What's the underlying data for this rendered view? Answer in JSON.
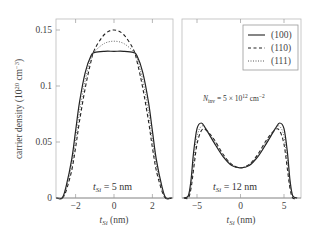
{
  "chart_data": [
    {
      "type": "line",
      "panel": "left",
      "annotation": "t_Si = 5 nm",
      "xlabel": "t_Si (nm)",
      "ylabel": "carrier density (10^20 cm^-3)",
      "xlim": [
        -3.2,
        3.2
      ],
      "ylim": [
        0,
        0.16
      ],
      "xticks": [
        -2,
        0,
        2
      ],
      "yticks": [
        0,
        0.05,
        0.1,
        0.15
      ],
      "ytick_labels": [
        "0",
        "0.05",
        "0.1",
        "0.15"
      ],
      "series": [
        {
          "name": "(100)",
          "style": "solid",
          "x": [
            -3.0,
            -2.7,
            -2.5,
            -2.2,
            -2.0,
            -1.8,
            -1.5,
            -1.2,
            -1.0,
            -0.5,
            0,
            0.5,
            1.0,
            1.2,
            1.5,
            1.8,
            2.0,
            2.2,
            2.5,
            2.7,
            3.0
          ],
          "y": [
            0,
            0.0,
            0.01,
            0.035,
            0.06,
            0.085,
            0.112,
            0.127,
            0.13,
            0.131,
            0.131,
            0.131,
            0.13,
            0.127,
            0.112,
            0.085,
            0.06,
            0.035,
            0.01,
            0.0,
            0
          ]
        },
        {
          "name": "(110)",
          "style": "dashed",
          "x": [
            -3.0,
            -2.7,
            -2.5,
            -2.2,
            -2.0,
            -1.8,
            -1.5,
            -1.2,
            -1.0,
            -0.5,
            0,
            0.5,
            1.0,
            1.2,
            1.5,
            1.8,
            2.0,
            2.2,
            2.5,
            2.7,
            3.0
          ],
          "y": [
            0,
            0.0,
            0.006,
            0.025,
            0.045,
            0.068,
            0.098,
            0.122,
            0.133,
            0.146,
            0.15,
            0.146,
            0.133,
            0.122,
            0.098,
            0.068,
            0.045,
            0.025,
            0.006,
            0.0,
            0
          ]
        },
        {
          "name": "(111)",
          "style": "dotted",
          "x": [
            -3.0,
            -2.7,
            -2.5,
            -2.2,
            -2.0,
            -1.8,
            -1.5,
            -1.2,
            -1.0,
            -0.5,
            0,
            0.5,
            1.0,
            1.2,
            1.5,
            1.8,
            2.0,
            2.2,
            2.5,
            2.7,
            3.0
          ],
          "y": [
            0,
            0.0,
            0.008,
            0.03,
            0.052,
            0.076,
            0.105,
            0.125,
            0.131,
            0.138,
            0.14,
            0.138,
            0.131,
            0.125,
            0.105,
            0.076,
            0.052,
            0.03,
            0.008,
            0.0,
            0
          ]
        }
      ]
    },
    {
      "type": "line",
      "panel": "right",
      "annotation": "t_Si = 12 nm",
      "annotation2": "N_inv = 5 × 10^12 cm^-2",
      "xlabel": "t_Si (nm)",
      "xlim": [
        -6.7,
        6.9
      ],
      "ylim": [
        0,
        0.16
      ],
      "xticks": [
        -5,
        0,
        5
      ],
      "legend": {
        "position": "upper right",
        "entries": [
          "(100)",
          "(110)",
          "(111)"
        ]
      },
      "series": [
        {
          "name": "(100)",
          "style": "solid",
          "x": [
            -6.5,
            -6.0,
            -5.7,
            -5.4,
            -5.0,
            -4.5,
            -4.0,
            -3.0,
            -2.0,
            -1.0,
            0,
            1.0,
            2.0,
            3.0,
            4.0,
            4.5,
            5.0,
            5.4,
            5.7,
            6.0,
            6.5
          ],
          "y": [
            0,
            0.002,
            0.015,
            0.04,
            0.062,
            0.067,
            0.062,
            0.049,
            0.037,
            0.029,
            0.027,
            0.029,
            0.037,
            0.049,
            0.062,
            0.067,
            0.062,
            0.04,
            0.015,
            0.002,
            0
          ]
        },
        {
          "name": "(110)",
          "style": "dashed",
          "x": [
            -6.5,
            -6.0,
            -5.7,
            -5.4,
            -5.0,
            -4.5,
            -4.0,
            -3.0,
            -2.0,
            -1.0,
            0,
            1.0,
            2.0,
            3.0,
            4.0,
            4.5,
            5.0,
            5.4,
            5.7,
            6.0,
            6.5
          ],
          "y": [
            0,
            0.0,
            0.008,
            0.025,
            0.048,
            0.06,
            0.061,
            0.052,
            0.039,
            0.03,
            0.027,
            0.03,
            0.039,
            0.052,
            0.061,
            0.06,
            0.048,
            0.025,
            0.008,
            0.0,
            0
          ]
        },
        {
          "name": "(111)",
          "style": "dotted",
          "x": [
            -6.5,
            -6.0,
            -5.7,
            -5.4,
            -5.0,
            -4.5,
            -4.0,
            -3.0,
            -2.0,
            -1.0,
            0,
            1.0,
            2.0,
            3.0,
            4.0,
            4.5,
            5.0,
            5.4,
            5.7,
            6.0,
            6.5
          ],
          "y": [
            0,
            0.001,
            0.011,
            0.032,
            0.055,
            0.064,
            0.062,
            0.051,
            0.038,
            0.03,
            0.027,
            0.03,
            0.038,
            0.051,
            0.062,
            0.064,
            0.055,
            0.032,
            0.011,
            0.001,
            0
          ]
        }
      ]
    }
  ],
  "labels": {
    "ylabel_main": "carrier density (10",
    "ylabel_exp": "20",
    "ylabel_unit": " cm",
    "ylabel_unit_exp": "−3",
    "ylabel_close": ")",
    "xlabel_t": "t",
    "xlabel_sub": "Si",
    "xlabel_unit": " (nm)",
    "left_annot_t": "t",
    "left_annot_sub": "Si",
    "left_annot_val": " = 5 nm",
    "right_annot_t": "t",
    "right_annot_sub": "Si",
    "right_annot_val": " = 12 nm",
    "ninv_N": "N",
    "ninv_sub": "inv",
    "ninv_val": " = 5 × 10",
    "ninv_exp": "12",
    "ninv_unit": " cm",
    "ninv_unit_exp": "−2",
    "yticks": [
      "0",
      "0.05",
      "0.1",
      "0.15"
    ],
    "left_xticks": [
      "−2",
      "0",
      "2"
    ],
    "right_xticks": [
      "−5",
      "0",
      "5"
    ],
    "legend": [
      "(100)",
      "(110)",
      "(111)"
    ]
  }
}
